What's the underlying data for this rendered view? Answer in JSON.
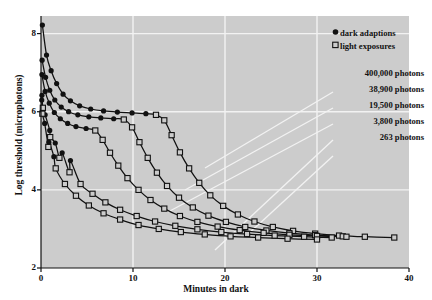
{
  "chart_data": {
    "type": "line",
    "title": "",
    "xlabel": "Minutes in dark",
    "ylabel": "Log threshold (microphotons)",
    "xlim": [
      0,
      40
    ],
    "ylim": [
      2,
      8.45
    ],
    "xticks": [
      0,
      10,
      20,
      30,
      40
    ],
    "yticks": [
      2,
      4,
      6,
      8
    ],
    "grid": true,
    "grid_color": "#f2f2f2",
    "background": "#cccccc",
    "legend_position": "top-right",
    "legend": [
      {
        "marker": "filled-circle",
        "label": "dark adaptions"
      },
      {
        "marker": "open-square",
        "label": "light exposures"
      }
    ],
    "annotations": [
      "400,000 photons",
      "38,900 photons",
      "19,500 photons",
      "3,800 photons",
      "263 photons"
    ],
    "series": [
      {
        "name": "400,000 photons",
        "dark_adaptions": [
          [
            0.15,
            8.22
          ],
          [
            0.6,
            7.45
          ],
          [
            1.1,
            7.05
          ],
          [
            1.7,
            6.72
          ],
          [
            2.4,
            6.45
          ],
          [
            3.2,
            6.28
          ],
          [
            4.2,
            6.15
          ],
          [
            5.4,
            6.07
          ],
          [
            6.8,
            6.02
          ],
          [
            8.3,
            5.99
          ],
          [
            9.9,
            5.97
          ],
          [
            11.4,
            5.95
          ]
        ],
        "light_exposures": [
          [
            12.5,
            5.92
          ],
          [
            13.4,
            5.78
          ],
          [
            14.2,
            5.4
          ],
          [
            15.1,
            4.96
          ],
          [
            16.1,
            4.55
          ],
          [
            17.2,
            4.18
          ],
          [
            18.4,
            3.86
          ],
          [
            19.8,
            3.59
          ],
          [
            21.4,
            3.37
          ],
          [
            23.2,
            3.19
          ],
          [
            25.2,
            3.05
          ],
          [
            27.4,
            2.95
          ],
          [
            29.8,
            2.88
          ],
          [
            32.4,
            2.83
          ],
          [
            35.2,
            2.8
          ],
          [
            38.4,
            2.78
          ]
        ]
      },
      {
        "name": "38,900 photons",
        "dark_adaptions": [
          [
            0.12,
            7.32
          ],
          [
            0.5,
            6.88
          ],
          [
            0.95,
            6.55
          ],
          [
            1.5,
            6.3
          ],
          [
            2.2,
            6.12
          ],
          [
            3.0,
            6.0
          ],
          [
            4.0,
            5.92
          ],
          [
            5.2,
            5.87
          ],
          [
            6.5,
            5.84
          ],
          [
            7.9,
            5.82
          ]
        ],
        "light_exposures": [
          [
            9.0,
            5.8
          ],
          [
            9.9,
            5.6
          ],
          [
            10.7,
            5.22
          ],
          [
            11.6,
            4.82
          ],
          [
            12.6,
            4.44
          ],
          [
            13.7,
            4.1
          ],
          [
            15.0,
            3.8
          ],
          [
            16.5,
            3.55
          ],
          [
            18.2,
            3.34
          ],
          [
            20.1,
            3.18
          ],
          [
            22.2,
            3.05
          ],
          [
            24.5,
            2.96
          ],
          [
            27.0,
            2.89
          ],
          [
            29.8,
            2.84
          ],
          [
            32.8,
            2.81
          ]
        ]
      },
      {
        "name": "19,500 photons",
        "dark_adaptions": [
          [
            0.1,
            6.95
          ],
          [
            0.45,
            6.52
          ],
          [
            0.9,
            6.22
          ],
          [
            1.45,
            5.98
          ],
          [
            2.1,
            5.82
          ],
          [
            2.9,
            5.7
          ],
          [
            3.8,
            5.62
          ],
          [
            4.9,
            5.57
          ]
        ],
        "light_exposures": [
          [
            5.9,
            5.52
          ],
          [
            6.7,
            5.28
          ],
          [
            7.5,
            4.95
          ],
          [
            8.4,
            4.62
          ],
          [
            9.4,
            4.3
          ],
          [
            10.6,
            4.0
          ],
          [
            11.9,
            3.74
          ],
          [
            13.4,
            3.52
          ],
          [
            15.1,
            3.33
          ],
          [
            17.0,
            3.18
          ],
          [
            19.2,
            3.06
          ],
          [
            21.6,
            2.97
          ],
          [
            24.2,
            2.9
          ],
          [
            27.0,
            2.85
          ],
          [
            30.0,
            2.82
          ],
          [
            33.2,
            2.8
          ]
        ]
      },
      {
        "name": "3,800 photons",
        "dark_adaptions": [
          [
            0.1,
            6.42
          ],
          [
            0.45,
            5.92
          ],
          [
            0.95,
            5.52
          ],
          [
            1.55,
            5.2
          ],
          [
            2.3,
            4.95
          ],
          [
            3.2,
            4.75
          ]
        ],
        "light_exposures": [
          [
            0.2,
            6.1
          ],
          [
            1.0,
            5.35
          ],
          [
            2.0,
            4.82
          ],
          [
            3.1,
            4.45
          ],
          [
            4.3,
            4.15
          ],
          [
            5.6,
            3.9
          ],
          [
            7.0,
            3.68
          ],
          [
            8.6,
            3.49
          ],
          [
            10.4,
            3.33
          ],
          [
            12.4,
            3.19
          ],
          [
            14.6,
            3.08
          ],
          [
            17.0,
            2.99
          ],
          [
            19.6,
            2.92
          ],
          [
            22.4,
            2.87
          ],
          [
            25.4,
            2.83
          ],
          [
            28.6,
            2.8
          ],
          [
            31.6,
            2.78
          ]
        ]
      },
      {
        "name": "263 photons",
        "dark_adaptions": [
          [
            0.08,
            6.3
          ],
          [
            0.4,
            5.7
          ],
          [
            0.85,
            5.22
          ],
          [
            1.4,
            4.85
          ]
        ],
        "light_exposures": [
          [
            0.15,
            5.95
          ],
          [
            0.8,
            5.1
          ],
          [
            1.6,
            4.55
          ],
          [
            2.6,
            4.15
          ],
          [
            3.8,
            3.85
          ],
          [
            5.2,
            3.6
          ],
          [
            6.8,
            3.4
          ],
          [
            8.6,
            3.24
          ],
          [
            10.6,
            3.1
          ],
          [
            12.8,
            3.0
          ],
          [
            15.2,
            2.92
          ],
          [
            17.8,
            2.86
          ],
          [
            20.6,
            2.81
          ],
          [
            23.6,
            2.78
          ],
          [
            26.8,
            2.75
          ],
          [
            30.0,
            2.73
          ]
        ]
      }
    ]
  }
}
